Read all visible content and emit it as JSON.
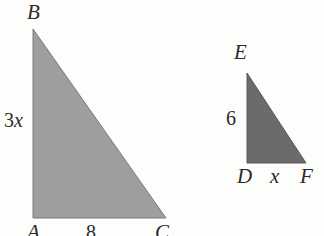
{
  "figure": {
    "background_color": "#fdfdfc",
    "ink_color": "#2b2b2b",
    "description_type": "geometry-diagram",
    "triangles": [
      {
        "id": "ABC",
        "fill_color": "#9e9e9e",
        "stroke_color": "#7a7a7a",
        "vertices": {
          "apex_label": "B",
          "bottom_left_label": "A",
          "bottom_right_label": "C"
        },
        "side_labels": {
          "vertical_leg": "3x",
          "horizontal_leg": "8"
        },
        "points": {
          "apex": [
            33,
            29
          ],
          "bottom_left": [
            33,
            218
          ],
          "bottom_right": [
            166,
            218
          ]
        }
      },
      {
        "id": "DEF",
        "fill_color": "#6b6b6b",
        "stroke_color": "#5a5a5a",
        "vertices": {
          "apex_label": "E",
          "bottom_left_label": "D",
          "bottom_right_label": "F"
        },
        "side_labels": {
          "vertical_leg": "6",
          "horizontal_leg": "x"
        },
        "points": {
          "apex": [
            247,
            73
          ],
          "bottom_left": [
            247,
            163
          ],
          "bottom_right": [
            306,
            163
          ]
        }
      }
    ]
  },
  "labels": {
    "B": "B",
    "A": "A",
    "C": "C",
    "three_x": "3",
    "three_x_var": "x",
    "eight": "8",
    "E": "E",
    "D": "D",
    "F": "F",
    "six": "6",
    "x": "x"
  }
}
